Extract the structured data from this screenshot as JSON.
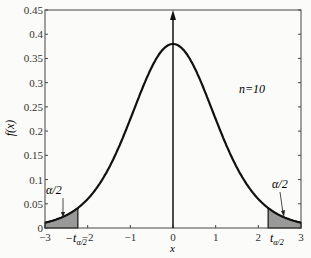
{
  "chart_data": {
    "type": "line",
    "title": "",
    "xlabel": "x",
    "ylabel": "f(x)",
    "xlim": [
      -3,
      3
    ],
    "ylim": [
      0,
      0.45
    ],
    "x_ticks": [
      "-3",
      "-2",
      "-1",
      "0",
      "1",
      "2",
      "3"
    ],
    "y_ticks": [
      "0",
      "0.05",
      "0.1",
      "0.15",
      "0.2",
      "0.25",
      "0.3",
      "0.35",
      "0.4",
      "0.45"
    ],
    "grid": false,
    "legend": null,
    "series": [
      {
        "name": "t-distribution density, n=10",
        "peak": {
          "x": 0,
          "y": 0.38
        },
        "tails": {
          "x": [
            -3,
            3
          ],
          "y": [
            0.0114,
            0.0114
          ]
        }
      }
    ],
    "annotations": {
      "n_label": "n=10",
      "alpha_left": "α/2",
      "alpha_right": "α/2",
      "t_left": "−t",
      "t_right": "t",
      "t_sub": "α/2",
      "shaded_regions": [
        {
          "from": -3,
          "to": -2.23
        },
        {
          "from": 2.23,
          "to": 3
        }
      ],
      "vertical_arrow_at": 0
    }
  }
}
